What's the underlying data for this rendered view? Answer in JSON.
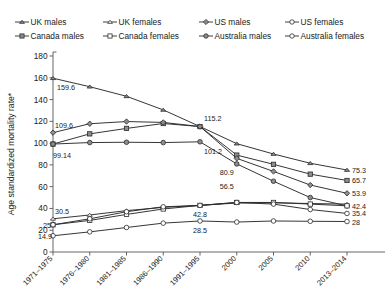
{
  "legend": {
    "items": [
      {
        "label": "UK males",
        "marker": "triangle",
        "fill": "filled",
        "icon": "triangle-marker-icon"
      },
      {
        "label": "UK females",
        "marker": "triangle",
        "fill": "open",
        "icon": "triangle-outline-marker-icon"
      },
      {
        "label": "US males",
        "marker": "diamond",
        "fill": "filled",
        "icon": "diamond-marker-icon"
      },
      {
        "label": "US females",
        "marker": "circle",
        "fill": "open",
        "icon": "circle-outline-marker-icon"
      },
      {
        "label": "Canada males",
        "marker": "square",
        "fill": "filled",
        "icon": "square-marker-icon"
      },
      {
        "label": "Canada females",
        "marker": "square",
        "fill": "open",
        "icon": "square-outline-marker-icon"
      },
      {
        "label": "Australia males",
        "marker": "circle",
        "fill": "filled",
        "icon": "circle-marker-icon"
      },
      {
        "label": "Australia females",
        "marker": "circle",
        "fill": "open",
        "icon": "circle-outline-marker-icon"
      }
    ]
  },
  "chart_data": {
    "type": "line",
    "title": "",
    "xlabel": "",
    "ylabel": "Age standardized mortality rate*",
    "ylim": [
      0,
      180
    ],
    "yticks": [
      0,
      20,
      40,
      60,
      80,
      100,
      120,
      140,
      160,
      180
    ],
    "grid": false,
    "legend_position": "top",
    "categories": [
      "1971–1975",
      "1976–1980",
      "1981–1985",
      "1986–1990",
      "1991–1995",
      "2000",
      "2005",
      "2010",
      "2013–2014"
    ],
    "series": [
      {
        "name": "UK males",
        "marker": "triangle",
        "fill": "filled",
        "values": [
          159.6,
          151.8,
          143.0,
          130.5,
          115.2,
          99.5,
          90.0,
          81.5,
          75.3
        ]
      },
      {
        "name": "Canada males",
        "marker": "square",
        "fill": "filled",
        "values": [
          99.14,
          108.5,
          113.5,
          118.0,
          115.2,
          89.0,
          80.5,
          71.5,
          65.7
        ]
      },
      {
        "name": "US males",
        "marker": "diamond",
        "fill": "filled",
        "values": [
          109.6,
          117.8,
          119.8,
          119.0,
          115.2,
          86.0,
          74.0,
          61.5,
          53.9
        ]
      },
      {
        "name": "Australia males",
        "marker": "circle",
        "fill": "filled",
        "values": [
          99.14,
          100.5,
          100.8,
          100.5,
          101.2,
          80.9,
          65.0,
          50.0,
          42.4
        ]
      },
      {
        "name": "UK females",
        "marker": "triangle",
        "fill": "open",
        "values": [
          30.5,
          34.0,
          38.0,
          41.0,
          42.8,
          45.0,
          45.2,
          44.5,
          44.0
        ]
      },
      {
        "name": "Canada females",
        "marker": "square",
        "fill": "open",
        "values": [
          25.0,
          29.0,
          34.5,
          39.5,
          42.8,
          45.5,
          45.5,
          44.0,
          42.4
        ]
      },
      {
        "name": "US females",
        "marker": "circle",
        "fill": "open",
        "values": [
          25.0,
          30.5,
          37.0,
          41.5,
          42.8,
          45.5,
          44.0,
          39.0,
          35.4
        ]
      },
      {
        "name": "Australia females",
        "marker": "circle",
        "fill": "open",
        "values": [
          14.9,
          18.5,
          22.5,
          26.5,
          28.5,
          27.5,
          28.5,
          28.2,
          28.0
        ]
      }
    ],
    "point_labels": [
      {
        "text": "159.6",
        "x_index": 0,
        "value": 159.6,
        "series": "UK males",
        "anchor": "start",
        "dx": 4,
        "dy": 12
      },
      {
        "text": "109.6",
        "x_index": 0,
        "value": 109.6,
        "series": "US males",
        "anchor": "start",
        "dx": 2,
        "dy": -5
      },
      {
        "text": "99.14",
        "x_index": 0,
        "value": 99.14,
        "series": "Canada males",
        "anchor": "start",
        "dx": 0,
        "dy": 14
      },
      {
        "text": "30.5",
        "x_index": 0,
        "value": 30.5,
        "series": "UK females",
        "anchor": "start",
        "dx": 2,
        "dy": -5
      },
      {
        "text": "25",
        "x_index": 0,
        "value": 25.0,
        "series": "Canada females",
        "anchor": "end",
        "dx": -2,
        "dy": 3
      },
      {
        "text": "14.9",
        "x_index": 0,
        "value": 14.9,
        "series": "Australia females",
        "anchor": "end",
        "dx": -1,
        "dy": 3
      },
      {
        "text": "115.2",
        "x_index": 4,
        "value": 115.2,
        "series": "UK males",
        "anchor": "start",
        "dx": 4,
        "dy": -6
      },
      {
        "text": "101.2",
        "x_index": 4,
        "value": 101.2,
        "series": "Australia males",
        "anchor": "start",
        "dx": 4,
        "dy": 12
      },
      {
        "text": "80.9",
        "x_index": 5,
        "value": 80.9,
        "series": "Australia males",
        "anchor": "end",
        "dx": -3,
        "dy": 11
      },
      {
        "text": "56.5",
        "x_index": 5,
        "value": 56.5,
        "series": "US males",
        "anchor": "end",
        "dx": -3,
        "dy": -1
      },
      {
        "text": "42.8",
        "x_index": 4,
        "value": 42.8,
        "series": "UK females",
        "anchor": "middle",
        "dx": 0,
        "dy": 12
      },
      {
        "text": "28.5",
        "x_index": 4,
        "value": 28.5,
        "series": "Australia females",
        "anchor": "middle",
        "dx": 0,
        "dy": 12
      },
      {
        "text": "75.3",
        "x_index": 8,
        "value": 75.3,
        "series": "UK males",
        "anchor": "start",
        "dx": 5,
        "dy": 3
      },
      {
        "text": "65.7",
        "x_index": 8,
        "value": 65.7,
        "series": "Canada males",
        "anchor": "start",
        "dx": 5,
        "dy": 3
      },
      {
        "text": "53.9",
        "x_index": 8,
        "value": 53.9,
        "series": "US males",
        "anchor": "start",
        "dx": 5,
        "dy": 3
      },
      {
        "text": "42.4",
        "x_index": 8,
        "value": 42.4,
        "series": "Australia males",
        "anchor": "start",
        "dx": 5,
        "dy": 3
      },
      {
        "text": "35.4",
        "x_index": 8,
        "value": 35.4,
        "series": "US females",
        "anchor": "start",
        "dx": 5,
        "dy": 3
      },
      {
        "text": "28",
        "x_index": 8,
        "value": 28.0,
        "series": "Australia females",
        "anchor": "start",
        "dx": 5,
        "dy": 3
      }
    ]
  }
}
